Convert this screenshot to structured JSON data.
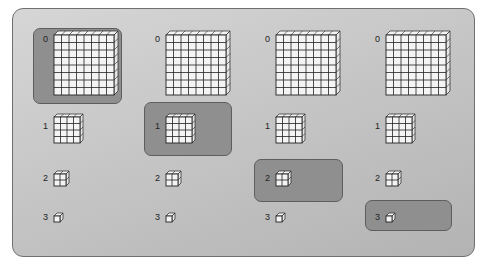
{
  "diagram": {
    "type": "mipmap-level-selection",
    "columns": 4,
    "levels": [
      {
        "label": "0",
        "grid": 8
      },
      {
        "label": "1",
        "grid": 4
      },
      {
        "label": "2",
        "grid": 2
      },
      {
        "label": "3",
        "grid": 1
      }
    ],
    "highlighted": [
      {
        "column": 0,
        "level": 0
      },
      {
        "column": 1,
        "level": 1
      },
      {
        "column": 2,
        "level": 2
      },
      {
        "column": 3,
        "level": 3
      }
    ],
    "colors": {
      "panel": "#c6c6c6",
      "highlight": "#8f8f8f",
      "cell_fill": "#f4f4f4",
      "grid_line": "#222222"
    }
  }
}
